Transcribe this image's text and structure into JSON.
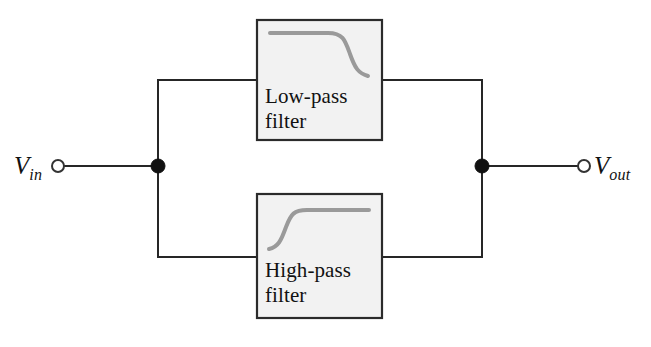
{
  "diagram": {
    "type": "circuit-block-diagram",
    "colors": {
      "wire": "#262626",
      "box_fill": "#f2f2f2",
      "box_border": "#2b2b2b",
      "curve": "#9a9a9a",
      "node": "#111111",
      "background": "#ffffff"
    },
    "terminals": [
      {
        "id": "input",
        "label_main": "V",
        "label_sub": "in",
        "label_full": "Vin",
        "x": 58,
        "y": 166
      },
      {
        "id": "output",
        "label_main": "V",
        "label_sub": "out",
        "label_full": "Vout",
        "x": 584,
        "y": 166
      }
    ],
    "nodes": [
      {
        "id": "left-junction",
        "x": 158,
        "y": 166
      },
      {
        "id": "right-junction",
        "x": 482,
        "y": 166
      }
    ],
    "blocks": [
      {
        "id": "low-pass",
        "label_line1": "Low-pass",
        "label_line2": "filter",
        "label": "Low-pass filter",
        "response": "flat then rolls off at high frequency",
        "x": 257,
        "y": 20,
        "width": 125,
        "height": 120
      },
      {
        "id": "high-pass",
        "label_line1": "High-pass",
        "label_line2": "filter",
        "label": "High-pass filter",
        "response": "rises from low level then flattens at high frequency",
        "x": 257,
        "y": 194,
        "width": 125,
        "height": 124
      }
    ]
  }
}
